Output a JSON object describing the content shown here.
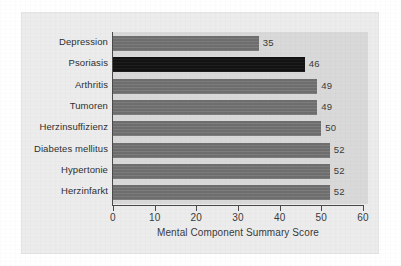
{
  "chart_data": {
    "type": "bar",
    "orientation": "horizontal",
    "title": "",
    "xlabel": "Mental Component Summary Score",
    "ylabel": "",
    "categories": [
      "Depression",
      "Psoriasis",
      "Arthritis",
      "Tumoren",
      "Herzinsuffizienz",
      "Diabetes mellitus",
      "Hypertonie",
      "Herzinfarkt"
    ],
    "values": [
      35,
      46,
      49,
      49,
      50,
      52,
      52,
      52
    ],
    "data_labels": [
      "35",
      "46",
      "49",
      "49",
      "50",
      "52",
      "52",
      "52"
    ],
    "xlim": [
      0,
      60
    ],
    "xticks": [
      0,
      10,
      20,
      30,
      40,
      50,
      60
    ],
    "xtick_labels": [
      "0",
      "10",
      "20",
      "30",
      "40",
      "50",
      "60"
    ],
    "grid": false,
    "legend": null,
    "highlight_category": "Psoriasis",
    "colors": {
      "bar": "#6e6e6e",
      "bar_highlight": "#121212",
      "plot_background": "#d9d9d9",
      "panel_background": "#ececec",
      "figure_background": "#ffffff",
      "axis": "#4a4a4a",
      "text": "#2f2f2f"
    }
  }
}
